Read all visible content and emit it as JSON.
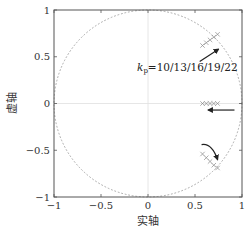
{
  "chart_data": {
    "type": "scatter",
    "title": "",
    "xlabel": "实轴",
    "ylabel": "虚轴",
    "xlim": [
      -1,
      1
    ],
    "ylim": [
      -1,
      1
    ],
    "xticks": [
      -1,
      -0.5,
      0,
      0.5,
      1
    ],
    "yticks": [
      -1,
      -0.5,
      0,
      0.5,
      1
    ],
    "xtick_labels": [
      "−1",
      "−0.5",
      "0",
      "0.5",
      "1"
    ],
    "ytick_labels": [
      "−1",
      "−0.5",
      "0",
      "0.5",
      "1"
    ],
    "grid": false,
    "zero_lines": true,
    "unit_circle": {
      "style": "dotted",
      "radius": 1
    },
    "annotation": {
      "text_k": "k",
      "text_sub": "p",
      "text_rest": "=10/13/16/19/22",
      "x": 0.73,
      "y": 0.3
    },
    "series": [
      {
        "name": "upper complex poles",
        "marker": "x",
        "points": [
          [
            0.58,
            0.62
          ],
          [
            0.62,
            0.65
          ],
          [
            0.66,
            0.68
          ],
          [
            0.7,
            0.71
          ],
          [
            0.74,
            0.74
          ]
        ]
      },
      {
        "name": "real poles",
        "marker": "x",
        "points": [
          [
            0.58,
            0.0
          ],
          [
            0.62,
            0.0
          ],
          [
            0.66,
            0.0
          ],
          [
            0.7,
            0.0
          ],
          [
            0.74,
            0.0
          ]
        ]
      },
      {
        "name": "lower complex poles",
        "marker": "x",
        "points": [
          [
            0.58,
            -0.54
          ],
          [
            0.62,
            -0.58
          ],
          [
            0.66,
            -0.62
          ],
          [
            0.7,
            -0.66
          ],
          [
            0.74,
            -0.69
          ]
        ]
      }
    ],
    "arrows": [
      {
        "from": [
          0.55,
          0.45
        ],
        "to": [
          0.75,
          0.58
        ],
        "meaning": "increasing kp, upper poles"
      },
      {
        "from": [
          0.92,
          -0.07
        ],
        "to": [
          0.64,
          -0.07
        ],
        "meaning": "increasing kp, real poles"
      },
      {
        "from": [
          0.57,
          -0.44
        ],
        "to": [
          0.74,
          -0.6
        ],
        "meaning": "increasing kp, lower poles"
      }
    ],
    "legend": null
  },
  "colors": {
    "axis": "#555555",
    "circle": "#aaaaaa",
    "markers": "#888888",
    "arrow": "#222222",
    "zero_line": "#e0e0e0"
  }
}
